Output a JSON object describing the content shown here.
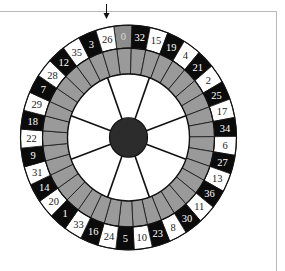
{
  "game": {
    "name": "Roulette wheel",
    "pointer": {
      "icon": "down-arrow-icon",
      "points_to": "26"
    },
    "wheel_order": [
      "0",
      "32",
      "15",
      "19",
      "4",
      "21",
      "2",
      "25",
      "17",
      "34",
      "6",
      "27",
      "13",
      "36",
      "11",
      "30",
      "8",
      "23",
      "10",
      "5",
      "24",
      "16",
      "33",
      "1",
      "20",
      "14",
      "31",
      "9",
      "22",
      "18",
      "29",
      "7",
      "28",
      "12",
      "35",
      "3",
      "26"
    ],
    "pocket_colors": {
      "0": "green",
      "black": [
        "32",
        "19",
        "21",
        "25",
        "34",
        "27",
        "36",
        "30",
        "23",
        "5",
        "16",
        "1",
        "14",
        "9",
        "18",
        "7",
        "12",
        "3"
      ],
      "red": [
        "15",
        "4",
        "2",
        "17",
        "6",
        "13",
        "11",
        "8",
        "10",
        "24",
        "33",
        "20",
        "31",
        "22",
        "29",
        "28",
        "35",
        "26"
      ]
    },
    "spoke_count": 8
  },
  "colors": {
    "black_pocket": "#0b0b0b",
    "red_pocket_render": "#ffffff",
    "zero_pocket": "#8c8c8c",
    "ring": "#9a9a9a",
    "hub": "#2c2c2c",
    "outline": "#111111",
    "frame": "#b8b8b8",
    "text_on_black": "#ffffff",
    "text_on_white": "#222222"
  }
}
